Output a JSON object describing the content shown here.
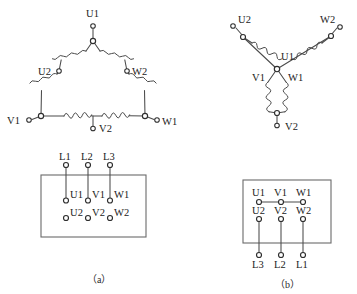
{
  "figure": {
    "colors": {
      "wire": "#4a4a4a",
      "box": "#6a6a6a",
      "terminal_fill": "#ffffff",
      "terminal_stroke": "#2e2e2e",
      "text": "#222222",
      "background": "#ffffff"
    }
  },
  "delta": {
    "name": "delta-connection-schematic",
    "labels": {
      "u1": "U1",
      "u2": "U2",
      "w2": "W2",
      "v1": "V1",
      "v2": "V2",
      "w1": "W1"
    }
  },
  "star": {
    "name": "star-connection-schematic",
    "labels": {
      "u2": "U2",
      "w2": "W2",
      "u1": "U1",
      "v1": "V1",
      "w1": "W1",
      "v2": "V2"
    }
  },
  "box_a": {
    "name": "terminal-block-delta",
    "line_terminals": [
      "L1",
      "L2",
      "L3"
    ],
    "row_top": [
      "U1",
      "V1",
      "W1"
    ],
    "row_bottom": [
      "U2",
      "V2",
      "W2"
    ],
    "caption": "（a）"
  },
  "box_b": {
    "name": "terminal-block-star",
    "row_top": [
      "U1",
      "V1",
      "W1"
    ],
    "row_bottom": [
      "U2",
      "V2",
      "W2"
    ],
    "line_terminals": [
      "L3",
      "L2",
      "L1"
    ],
    "caption": "（b）"
  }
}
